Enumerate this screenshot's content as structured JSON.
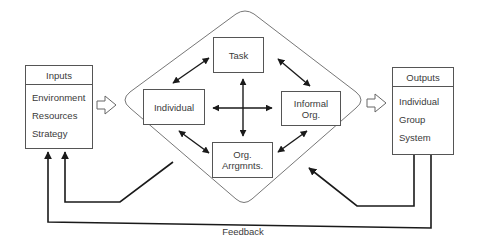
{
  "diagram": {
    "type": "organizational congruence model",
    "inputs": {
      "title": "Inputs",
      "items": [
        "Environment",
        "Resources",
        "Strategy"
      ]
    },
    "outputs": {
      "title": "Outputs",
      "items": [
        "Individual",
        "Group",
        "System"
      ]
    },
    "components": {
      "task": [
        "Task"
      ],
      "individual": [
        "Individual"
      ],
      "informal_org": [
        "Informal",
        "Org."
      ],
      "org_arrangements": [
        "Org.",
        "Arrgmnts."
      ]
    },
    "feedback_label": "Feedback",
    "colors": {
      "line": "#1a1a1a",
      "box_border": "#555555",
      "diamond_border": "#777777",
      "text": "#3a3a3a",
      "background": "#ffffff"
    }
  }
}
